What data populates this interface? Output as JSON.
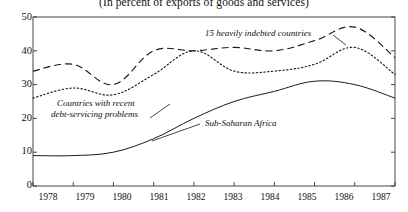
{
  "subtitle": "(In percent of exports of goods and services)",
  "axes": {
    "y_ticks": [
      "0",
      "10",
      "20",
      "30",
      "40",
      "50"
    ],
    "x_ticks": [
      "1978",
      "1979",
      "1980",
      "1981",
      "1982",
      "1983",
      "1984",
      "1985",
      "1986",
      "1987"
    ]
  },
  "labels": {
    "heavily_indebted": "15 heavily indebted countries",
    "debt_servicing_line1": "Countries with recent",
    "debt_servicing_line2": "debt-servicing problems",
    "sub_saharan": "Sub-Saharan Africa"
  },
  "colors": {
    "ink": "#1a1a1a",
    "axis": "#333333"
  },
  "chart_data": {
    "type": "line",
    "title": "",
    "subtitle": "(In percent of exports of goods and services)",
    "xlabel": "",
    "ylabel": "",
    "x": [
      1978,
      1979,
      1980,
      1981,
      1982,
      1983,
      1984,
      1985,
      1986,
      1987
    ],
    "categories": [
      "1978",
      "1979",
      "1980",
      "1981",
      "1982",
      "1983",
      "1984",
      "1985",
      "1986",
      "1987"
    ],
    "ylim": [
      0,
      50
    ],
    "xlim": [
      1978,
      1987
    ],
    "grid": false,
    "legend": "inline-annotations",
    "series": [
      {
        "name": "Countries with recent debt-servicing problems",
        "style": "dashed",
        "values": [
          34,
          36,
          30,
          40,
          40,
          41,
          40,
          43,
          47,
          38
        ]
      },
      {
        "name": "15 heavily indebted countries",
        "style": "dotted",
        "values": [
          26,
          29,
          27,
          33,
          40,
          34,
          34,
          36,
          41,
          33
        ]
      },
      {
        "name": "Sub-Saharan Africa",
        "style": "solid",
        "values": [
          9,
          9,
          10,
          14,
          20,
          25,
          28,
          31,
          30,
          26
        ]
      }
    ]
  }
}
